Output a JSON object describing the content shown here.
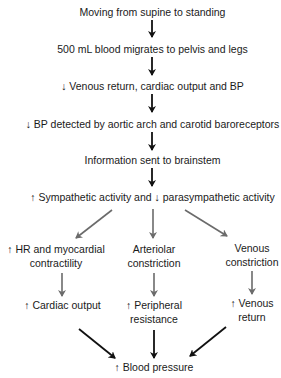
{
  "diagram": {
    "type": "flowchart",
    "colors": {
      "main_arrow": "#111111",
      "branch_arrow": "#6b6b6b",
      "text": "#1a1a1a"
    },
    "nodes": {
      "n1": {
        "lines": [
          "Moving from supine to standing"
        ]
      },
      "n2": {
        "lines": [
          "500 mL blood migrates to pelvis and legs"
        ]
      },
      "n3": {
        "lines": [
          "↓ Venous return, cardiac output and BP"
        ]
      },
      "n4": {
        "lines": [
          "↓ BP detected by aortic arch and carotid baroreceptors"
        ]
      },
      "n5": {
        "lines": [
          "Information sent to brainstem"
        ]
      },
      "n6": {
        "lines": [
          "↑ Sympathetic activity and ↓ parasympathetic activity"
        ]
      },
      "left_a": {
        "lines": [
          "↑ HR and myocardial",
          "contractility"
        ]
      },
      "mid_a": {
        "lines": [
          "Arteriolar",
          "constriction"
        ]
      },
      "right_a": {
        "lines": [
          "Venous",
          "constriction"
        ]
      },
      "left_b": {
        "lines": [
          "↑ Cardiac output"
        ]
      },
      "mid_b": {
        "lines": [
          "↑ Peripheral",
          "resistance"
        ]
      },
      "right_b": {
        "lines": [
          "↑ Venous",
          "return"
        ]
      },
      "final": {
        "lines": [
          "↑ Blood pressure"
        ]
      }
    },
    "edges": [
      [
        "n1",
        "n2"
      ],
      [
        "n2",
        "n3"
      ],
      [
        "n3",
        "n4"
      ],
      [
        "n4",
        "n5"
      ],
      [
        "n5",
        "n6"
      ],
      [
        "n6",
        "left_a"
      ],
      [
        "n6",
        "mid_a"
      ],
      [
        "n6",
        "right_a"
      ],
      [
        "left_a",
        "left_b"
      ],
      [
        "mid_a",
        "mid_b"
      ],
      [
        "right_a",
        "right_b"
      ],
      [
        "left_b",
        "final"
      ],
      [
        "mid_b",
        "final"
      ],
      [
        "right_b",
        "final"
      ]
    ]
  }
}
